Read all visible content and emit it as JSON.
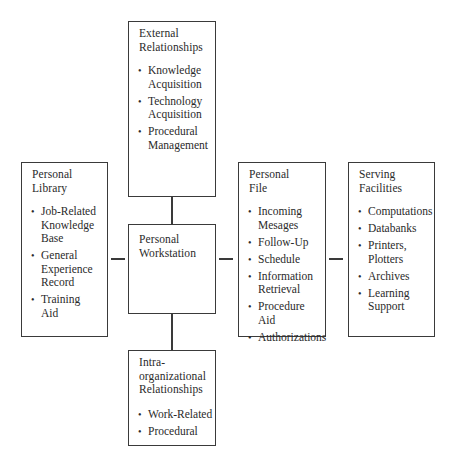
{
  "diagram": {
    "center": {
      "title": "Personal\nWorkstation"
    },
    "top": {
      "title": "External\nRelationships",
      "items": [
        "Knowledge\nAcquisition",
        "Technology\nAcquisition",
        "Procedural\nManagement"
      ]
    },
    "left": {
      "title": "Personal\nLibrary",
      "items": [
        "Job-Related\nKnowledge\nBase",
        "General\nExperience\nRecord",
        "Training\nAid"
      ]
    },
    "right": {
      "title": "Personal\nFile",
      "items": [
        "Incoming\nMesages",
        "Follow-Up",
        "Schedule",
        "Information\nRetrieval",
        "Procedure\nAid",
        "Authorizations"
      ]
    },
    "far_right": {
      "title": "Serving\nFacilities",
      "items": [
        "Computations",
        "Databanks",
        "Printers,\nPlotters",
        "Archives",
        "Learning\nSupport"
      ]
    },
    "bottom": {
      "title": "Intra-\norganizational\nRelationships",
      "items": [
        "Work-Related",
        "Procedural"
      ]
    }
  }
}
